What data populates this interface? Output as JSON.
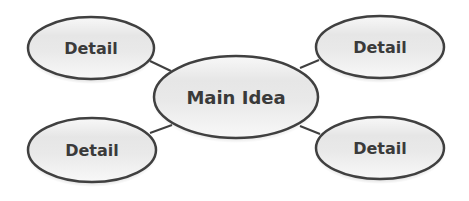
{
  "diagram": {
    "type": "concept-map",
    "colors": {
      "background": "#ffffff",
      "stroke": "#404040",
      "fill_light": "#f7f7f7",
      "fill_mid": "#e2e2e2",
      "text": "#3a3a3a"
    },
    "main": {
      "label": "Main Idea",
      "cx": 236,
      "cy": 97,
      "rx": 82,
      "ry": 41
    },
    "details": [
      {
        "label": "Detail",
        "position": "top-left",
        "cx": 91,
        "cy": 48,
        "rx": 63,
        "ry": 31
      },
      {
        "label": "Detail",
        "position": "top-right",
        "cx": 380,
        "cy": 47,
        "rx": 64,
        "ry": 31
      },
      {
        "label": "Detail",
        "position": "bottom-left",
        "cx": 92,
        "cy": 150,
        "rx": 64,
        "ry": 32
      },
      {
        "label": "Detail",
        "position": "bottom-right",
        "cx": 380,
        "cy": 148,
        "rx": 64,
        "ry": 31
      }
    ],
    "connectors": [
      {
        "from": "top-left",
        "x1": 150,
        "y1": 61,
        "x2": 171,
        "y2": 71
      },
      {
        "from": "top-right",
        "x1": 319,
        "y1": 60,
        "x2": 300,
        "y2": 68
      },
      {
        "from": "bottom-left",
        "x1": 150,
        "y1": 133,
        "x2": 172,
        "y2": 125
      },
      {
        "from": "bottom-right",
        "x1": 320,
        "y1": 134,
        "x2": 300,
        "y2": 126
      }
    ]
  }
}
